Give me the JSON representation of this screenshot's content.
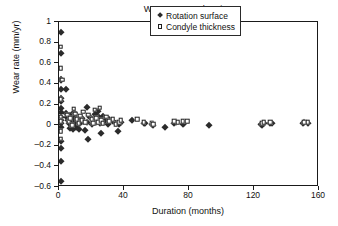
{
  "chart_data": {
    "type": "scatter",
    "title": "Wear rate vs. duration",
    "xlabel": "Duration (months)",
    "ylabel": "Wear rate (mm/yr)",
    "xlim": [
      0,
      160
    ],
    "ylim": [
      -0.6,
      1
    ],
    "xticks": [
      0,
      40,
      80,
      120,
      160
    ],
    "yticks": [
      -0.6,
      -0.4,
      -0.2,
      0,
      0.2,
      0.4,
      0.6,
      0.8,
      1
    ],
    "xtick_labels": [
      "0",
      "40",
      "80",
      "120",
      "160"
    ],
    "ytick_labels": [
      "-0.6",
      "-0.4",
      "-0.2",
      "0",
      "0.2",
      "0.4",
      "0.6",
      "0.8",
      "1"
    ],
    "grid": false,
    "legend_position": "top-right",
    "series": [
      {
        "name": "Rotation surface",
        "marker": "filled-diamond",
        "color": "#2b2b2b",
        "points": [
          [
            1.0,
            0.9
          ],
          [
            1.2,
            0.7
          ],
          [
            1.0,
            0.45
          ],
          [
            1.5,
            0.44
          ],
          [
            1.0,
            0.35
          ],
          [
            1.0,
            0.26
          ],
          [
            1.2,
            0.23
          ],
          [
            1.0,
            0.17
          ],
          [
            1.3,
            0.13
          ],
          [
            1.0,
            0.08
          ],
          [
            1.0,
            0.05
          ],
          [
            1.1,
            0.02
          ],
          [
            1.0,
            -0.02
          ],
          [
            1.0,
            -0.15
          ],
          [
            1.0,
            -0.22
          ],
          [
            1.5,
            -0.35
          ],
          [
            1.2,
            -0.54
          ],
          [
            4.0,
            0.35
          ],
          [
            4.5,
            0.12
          ],
          [
            5.0,
            0.08
          ],
          [
            5.5,
            0.05
          ],
          [
            6.0,
            0.02
          ],
          [
            6.5,
            -0.03
          ],
          [
            7.0,
            0.1
          ],
          [
            7.5,
            0.06
          ],
          [
            8.0,
            0.0
          ],
          [
            8.5,
            -0.04
          ],
          [
            9.0,
            0.13
          ],
          [
            9.5,
            0.07
          ],
          [
            10.0,
            0.03
          ],
          [
            10.5,
            -0.02
          ],
          [
            11.0,
            0.09
          ],
          [
            12.0,
            0.05
          ],
          [
            12.5,
            -0.04
          ],
          [
            13.0,
            0.02
          ],
          [
            14.0,
            0.07
          ],
          [
            15.0,
            0.04
          ],
          [
            16.0,
            -0.05
          ],
          [
            17.0,
            0.18
          ],
          [
            17.5,
            0.03
          ],
          [
            18.0,
            -0.13
          ],
          [
            19.0,
            0.08
          ],
          [
            20.0,
            0.01
          ],
          [
            21.0,
            0.06
          ],
          [
            22.0,
            0.11
          ],
          [
            23.0,
            0.03
          ],
          [
            24.0,
            0.14
          ],
          [
            24.5,
            0.08
          ],
          [
            25.0,
            0.02
          ],
          [
            26.0,
            -0.08
          ],
          [
            27.0,
            0.09
          ],
          [
            28.0,
            0.05
          ],
          [
            29.0,
            0.07
          ],
          [
            30.0,
            0.01
          ],
          [
            31.0,
            0.06
          ],
          [
            33.0,
            0.04
          ],
          [
            35.0,
            0.02
          ],
          [
            36.0,
            -0.06
          ],
          [
            37.0,
            0.01
          ],
          [
            38.0,
            0.03
          ],
          [
            45.0,
            0.05
          ],
          [
            52.0,
            0.02
          ],
          [
            53.0,
            0.02
          ],
          [
            57.0,
            0.01
          ],
          [
            58.0,
            0.0
          ],
          [
            65.0,
            -0.02
          ],
          [
            71.0,
            0.02
          ],
          [
            72.0,
            0.03
          ],
          [
            76.0,
            0.01
          ],
          [
            77.0,
            0.02
          ],
          [
            92.0,
            0.0
          ],
          [
            124.0,
            0.01
          ],
          [
            125.0,
            0.0
          ],
          [
            126.0,
            0.02
          ],
          [
            130.0,
            0.02
          ],
          [
            131.0,
            0.02
          ],
          [
            150.0,
            0.02
          ],
          [
            151.0,
            0.03
          ],
          [
            153.0,
            0.02
          ]
        ]
      },
      {
        "name": "Condyle thickness",
        "marker": "open-square",
        "color": "#1f1f1f",
        "points": [
          [
            1.0,
            0.76
          ],
          [
            1.0,
            0.55
          ],
          [
            2.0,
            0.44
          ],
          [
            1.0,
            0.25
          ],
          [
            1.0,
            0.08
          ],
          [
            1.0,
            0.04
          ],
          [
            1.0,
            -0.06
          ],
          [
            1.0,
            -0.13
          ],
          [
            5.0,
            0.1
          ],
          [
            6.0,
            0.04
          ],
          [
            7.0,
            0.07
          ],
          [
            8.0,
            0.0
          ],
          [
            9.0,
            0.16
          ],
          [
            10.0,
            0.11
          ],
          [
            11.0,
            0.06
          ],
          [
            12.0,
            0.02
          ],
          [
            13.0,
            0.09
          ],
          [
            14.0,
            0.05
          ],
          [
            15.0,
            0.13
          ],
          [
            16.0,
            0.03
          ],
          [
            18.0,
            0.1
          ],
          [
            20.0,
            0.06
          ],
          [
            21.0,
            0.02
          ],
          [
            22.0,
            0.15
          ],
          [
            23.0,
            0.07
          ],
          [
            24.0,
            0.03
          ],
          [
            25.0,
            0.17
          ],
          [
            26.0,
            0.05
          ],
          [
            27.0,
            0.02
          ],
          [
            29.0,
            0.08
          ],
          [
            31.0,
            0.04
          ],
          [
            33.0,
            0.06
          ],
          [
            35.0,
            0.01
          ],
          [
            37.0,
            0.03
          ],
          [
            38.0,
            0.05
          ],
          [
            48.0,
            0.06
          ],
          [
            52.0,
            0.03
          ],
          [
            57.0,
            0.02
          ],
          [
            58.0,
            0.01
          ],
          [
            71.0,
            0.04
          ],
          [
            73.0,
            0.03
          ],
          [
            76.0,
            0.04
          ],
          [
            79.0,
            0.04
          ],
          [
            125.0,
            0.02
          ],
          [
            126.0,
            0.03
          ],
          [
            130.0,
            0.03
          ],
          [
            151.0,
            0.03
          ],
          [
            153.0,
            0.03
          ]
        ]
      }
    ]
  },
  "legend": {
    "entries": [
      {
        "label": "Rotation surface",
        "marker": "filled-diamond"
      },
      {
        "label": "Condyle thickness",
        "marker": "open-square"
      }
    ]
  }
}
